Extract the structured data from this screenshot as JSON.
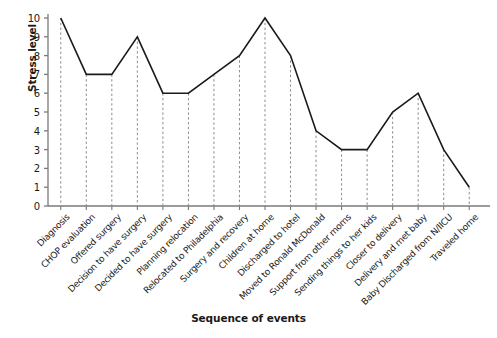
{
  "chart_data": {
    "type": "line",
    "title": "",
    "xlabel": "Sequence of events",
    "ylabel": "Stress level",
    "ylim": [
      0,
      10
    ],
    "yticks": [
      "0",
      "1",
      "2",
      "3",
      "4",
      "5",
      "6",
      "7",
      "8",
      "9",
      "10"
    ],
    "grid": "vertical-dashed-droplines",
    "legend": "none",
    "categories": [
      "Diagnosis",
      "CHOP evaluation",
      "Offered surgery",
      "Decision to have surgery",
      "Decided to have surgery",
      "Planning relocation",
      "Relocated to Philadelphia",
      "Surgery and recovery",
      "Children at home",
      "Discharged to hotel",
      "Moved to Ronald McDonald",
      "Support from other moms",
      "Sending things to her kids",
      "Closer to delivery",
      "Delivery and met baby",
      "Baby Discharged from N/IICU",
      "Traveled home"
    ],
    "values": [
      10,
      7,
      7,
      9,
      6,
      6,
      7,
      8,
      10,
      8,
      4,
      3,
      3,
      5,
      6,
      3,
      1
    ],
    "line_color": "#1a1a1a",
    "dropline_color": "#8c8c8c",
    "axis_color": "#7a7a7a",
    "background": "#ffffff"
  }
}
